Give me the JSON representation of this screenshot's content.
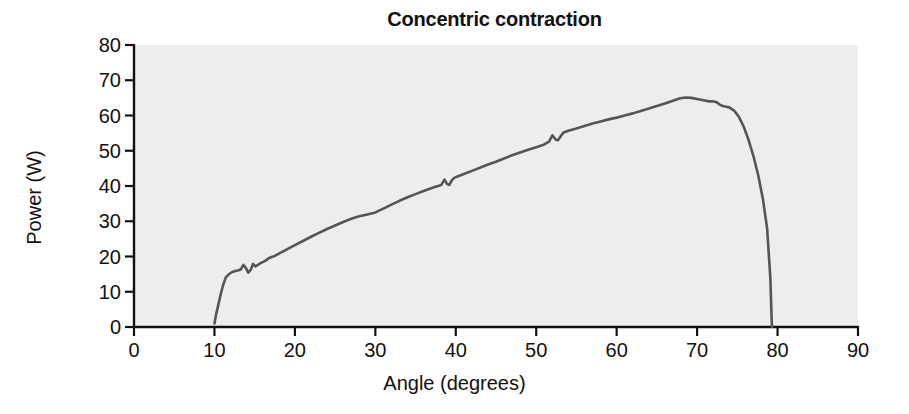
{
  "chart_data": {
    "type": "line",
    "title": "Concentric contraction",
    "xlabel": "Angle (degrees)",
    "ylabel": "Power (W)",
    "xlim": [
      0,
      90
    ],
    "ylim": [
      0,
      80
    ],
    "xticks": [
      0,
      10,
      20,
      30,
      40,
      50,
      60,
      70,
      80,
      90
    ],
    "yticks": [
      0,
      10,
      20,
      30,
      40,
      50,
      60,
      70,
      80
    ],
    "grid": false,
    "legend": null,
    "series": [
      {
        "name": "Power",
        "color": "#555555",
        "x": [
          10.0,
          10.2,
          10.5,
          10.8,
          11.1,
          11.4,
          11.8,
          12.2,
          12.6,
          13.0,
          13.3,
          13.6,
          13.9,
          14.2,
          14.5,
          14.8,
          15.1,
          15.4,
          15.7,
          16.0,
          16.4,
          16.8,
          17.2,
          17.6,
          18.0,
          19.0,
          20.0,
          21.0,
          22.0,
          23.0,
          24.0,
          25.0,
          26.0,
          27.0,
          28.0,
          29.0,
          30.0,
          31.0,
          32.0,
          33.0,
          34.0,
          35.0,
          36.0,
          36.6,
          37.2,
          37.8,
          38.2,
          38.6,
          38.9,
          39.2,
          39.5,
          39.8,
          40.2,
          41.0,
          42.0,
          43.0,
          44.0,
          45.0,
          46.0,
          47.0,
          48.0,
          49.0,
          50.0,
          51.0,
          51.6,
          52.0,
          52.4,
          52.7,
          53.0,
          53.4,
          54.0,
          55.0,
          56.0,
          57.0,
          58.0,
          59.0,
          60.0,
          61.0,
          62.0,
          63.0,
          64.0,
          65.0,
          66.0,
          67.0,
          67.8,
          68.5,
          69.3,
          70.0,
          70.8,
          71.5,
          72.0,
          72.4,
          72.8,
          73.2,
          73.6,
          74.0,
          74.6,
          75.2,
          75.8,
          76.4,
          77.0,
          77.6,
          78.2,
          78.7,
          79.1,
          79.3
        ],
        "y": [
          1.0,
          3.5,
          6.5,
          9.5,
          12.0,
          14.0,
          15.0,
          15.6,
          15.9,
          16.1,
          16.4,
          17.6,
          16.8,
          15.4,
          16.2,
          17.9,
          17.2,
          17.6,
          18.1,
          18.4,
          18.9,
          19.6,
          19.9,
          20.3,
          20.8,
          22.0,
          23.2,
          24.4,
          25.6,
          26.7,
          27.8,
          28.8,
          29.8,
          30.7,
          31.4,
          31.9,
          32.5,
          33.6,
          34.7,
          35.8,
          36.8,
          37.7,
          38.6,
          39.1,
          39.6,
          40.0,
          40.3,
          41.8,
          40.6,
          40.3,
          41.6,
          42.3,
          42.7,
          43.4,
          44.3,
          45.2,
          46.1,
          46.9,
          47.8,
          48.7,
          49.5,
          50.3,
          51.0,
          51.8,
          52.6,
          54.4,
          53.2,
          53.0,
          54.0,
          55.2,
          55.7,
          56.3,
          57.0,
          57.7,
          58.3,
          58.9,
          59.4,
          60.0,
          60.6,
          61.3,
          62.0,
          62.7,
          63.4,
          64.2,
          64.8,
          65.1,
          65.0,
          64.7,
          64.3,
          64.0,
          64.0,
          63.8,
          63.1,
          62.7,
          62.5,
          62.3,
          61.4,
          59.6,
          56.8,
          53.0,
          48.5,
          43.0,
          36.0,
          28.0,
          14.0,
          0.0
        ]
      }
    ],
    "annotations": []
  },
  "axes": {
    "y_tick_labels": [
      "80",
      "70",
      "60",
      "50",
      "40",
      "30",
      "20",
      "10",
      "0"
    ],
    "x_tick_labels": [
      "0",
      "10",
      "20",
      "30",
      "40",
      "50",
      "60",
      "70",
      "80",
      "90"
    ]
  },
  "style": {
    "plot_bg": "#ededed",
    "axis_color": "#111111",
    "line_color": "#555555",
    "page_bg": "#ffffff"
  }
}
